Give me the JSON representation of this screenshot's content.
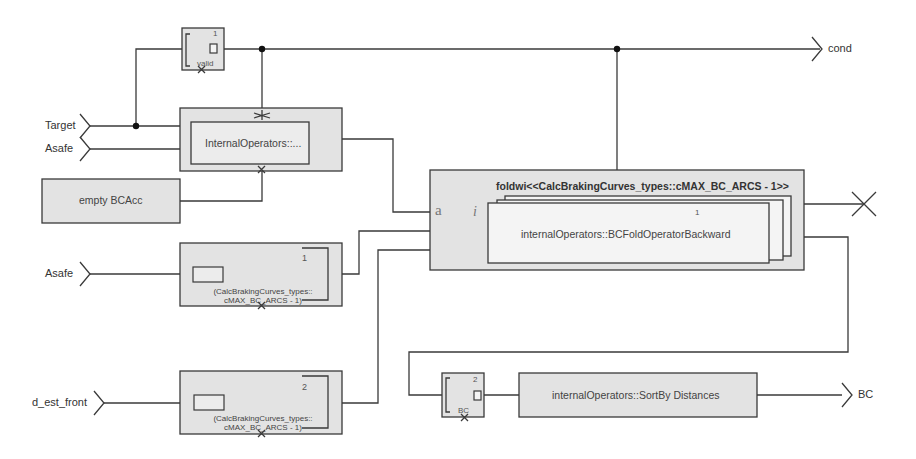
{
  "inputs": {
    "target": "Target",
    "asafe_top": "Asafe",
    "asafe_mid": "Asafe",
    "d_est_front": "d_est_front"
  },
  "outputs": {
    "cond": "cond",
    "bc": "BC"
  },
  "blocks": {
    "valid_proj": {
      "index": "1",
      "label": "valid"
    },
    "internal_operators": {
      "label": "InternalOperators::..."
    },
    "empty_bcacc": {
      "label": "empty BCAcc"
    },
    "fold": {
      "title": "foldwi<<CalcBrakingCurves_types::cMAX_BC_ARCS - 1>>",
      "acc_port": "a",
      "iter_port": "i",
      "index": "1",
      "operator": "internalOperators::BCFoldOperatorBackward"
    },
    "slice1": {
      "index": "1",
      "line1": "(CalcBrakingCurves_types::",
      "line2": "cMAX_BC_ARCS - 1)"
    },
    "slice2": {
      "index": "2",
      "line1": "(CalcBrakingCurves_types::",
      "line2": "cMAX_BC_ARCS - 1)"
    },
    "bc_proj": {
      "index": "2",
      "label": "BC"
    },
    "sort": {
      "label": "internalOperators::SortBy Distances"
    }
  },
  "colors": {
    "block_fill": "#e3e3e3",
    "inner_fill": "#ececec",
    "wire": "#3a3a3a",
    "background": "#ffffff"
  }
}
